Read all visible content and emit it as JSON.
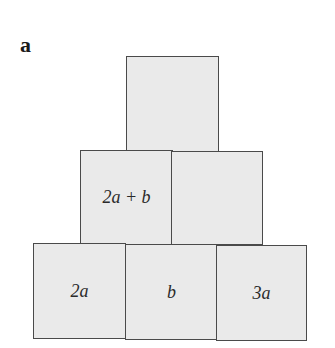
{
  "figure": {
    "label": "a",
    "fill_color": "#eaeaea",
    "border_color": "#4a4a4a",
    "rows": [
      {
        "name": "top",
        "cells": [
          {
            "text": ""
          }
        ]
      },
      {
        "name": "middle",
        "cells": [
          {
            "text": "2a + b"
          },
          {
            "text": ""
          }
        ]
      },
      {
        "name": "bottom",
        "cells": [
          {
            "text": "2a"
          },
          {
            "text": "b"
          },
          {
            "text": "3a"
          }
        ]
      }
    ]
  }
}
